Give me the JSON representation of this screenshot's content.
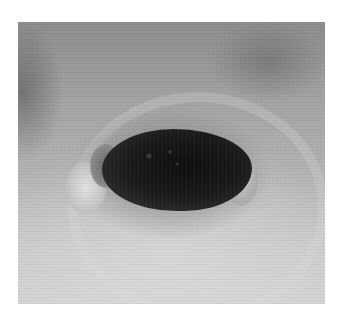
{
  "image": {
    "description": "Grayscale clinical photograph of a skin wound with dark central necrotic eschar and pale sloughy margins",
    "color_mode": "grayscale",
    "colors": {
      "background": "#ffffff",
      "skin_dark": "#8c8c8c",
      "skin_light": "#d3d3d3",
      "eschar": "#0e0e0e",
      "slough": "#e2e2e2"
    }
  }
}
